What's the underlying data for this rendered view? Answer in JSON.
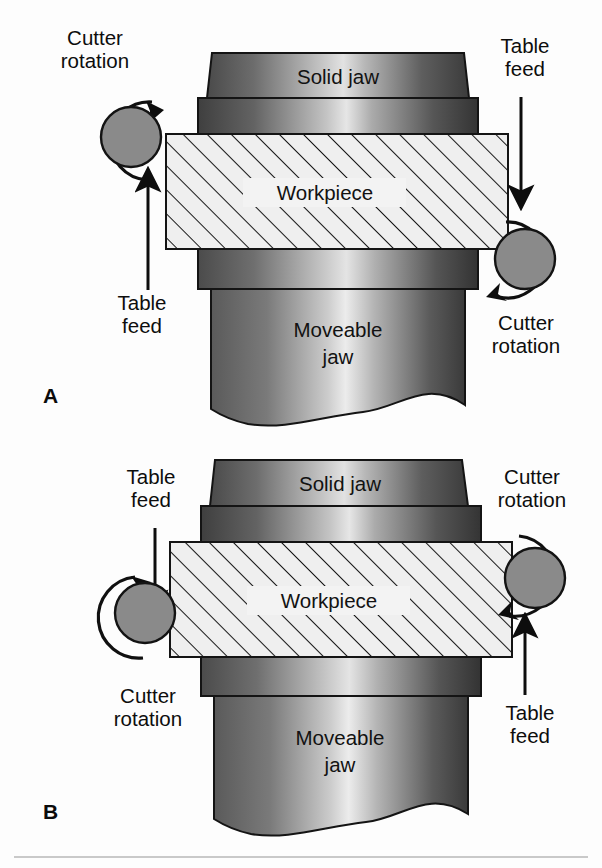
{
  "figure": {
    "type": "technical-diagram",
    "background_color": "#fdfdfd",
    "ink_color": "#111111",
    "cutter_color": "#8a8a8a",
    "workpiece_color": "#efefef",
    "jaw_gradient_dark": "#4c4c4c",
    "jaw_gradient_light": "#d8d8d8"
  },
  "panels": [
    {
      "id": "A",
      "label": "A",
      "parts": {
        "solid_jaw": "Solid jaw",
        "workpiece": "Workpiece",
        "moveable_jaw": "Moveable jaw",
        "moveable_jaw_line1": "Moveable",
        "moveable_jaw_line2": "jaw"
      },
      "callouts": [
        {
          "id": "a-top-left",
          "label": "Cutter rotation",
          "line1": "Cutter",
          "line2": "rotation",
          "position": "top-left",
          "cutter_rotation": "clockwise"
        },
        {
          "id": "a-top-right",
          "label": "Table feed",
          "line1": "Table",
          "line2": "feed",
          "position": "top-right",
          "arrow_direction": "down"
        },
        {
          "id": "a-bottom-left",
          "label": "Table feed",
          "line1": "Table",
          "line2": "feed",
          "position": "bottom-left",
          "arrow_direction": "up"
        },
        {
          "id": "a-bottom-right",
          "label": "Cutter rotation",
          "line1": "Cutter",
          "line2": "rotation",
          "position": "bottom-right",
          "cutter_rotation": "clockwise"
        }
      ]
    },
    {
      "id": "B",
      "label": "B",
      "parts": {
        "solid_jaw": "Solid jaw",
        "workpiece": "Workpiece",
        "moveable_jaw": "Moveable jaw",
        "moveable_jaw_line1": "Moveable",
        "moveable_jaw_line2": "jaw"
      },
      "callouts": [
        {
          "id": "b-top-left",
          "label": "Table feed",
          "line1": "Table",
          "line2": "feed",
          "position": "top-left",
          "arrow_direction": "down"
        },
        {
          "id": "b-top-right",
          "label": "Cutter rotation",
          "line1": "Cutter",
          "line2": "rotation",
          "position": "top-right",
          "cutter_rotation": "clockwise"
        },
        {
          "id": "b-bottom-left",
          "label": "Cutter rotation",
          "line1": "Cutter",
          "line2": "rotation",
          "position": "bottom-left",
          "cutter_rotation": "clockwise"
        },
        {
          "id": "b-bottom-right",
          "label": "Table feed",
          "line1": "Table",
          "line2": "feed",
          "position": "bottom-right",
          "arrow_direction": "up"
        }
      ]
    }
  ]
}
